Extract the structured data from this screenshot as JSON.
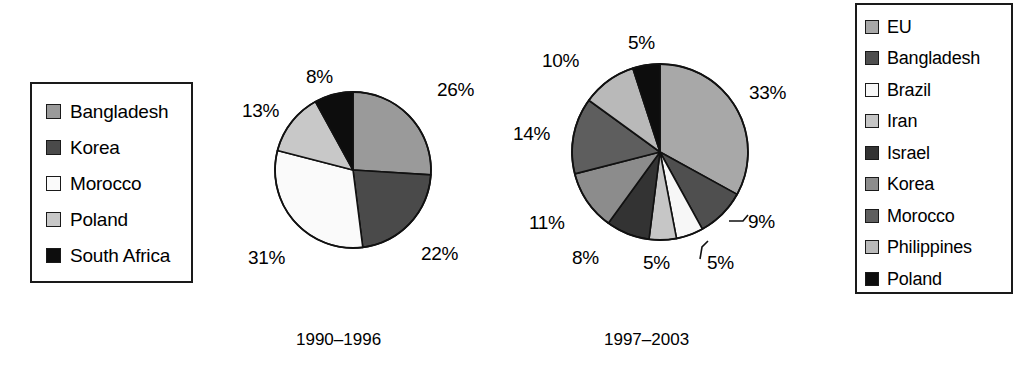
{
  "chart_data": [
    {
      "type": "pie",
      "title": "1990-1996",
      "categories": [
        "Bangladesh",
        "Korea",
        "Morocco",
        "Poland",
        "South Africa"
      ],
      "values": [
        26,
        22,
        31,
        13,
        8
      ],
      "labels": [
        "26%",
        "22%",
        "31%",
        "13%",
        "8%"
      ],
      "colors": [
        "#9a9a9a",
        "#4a4a4a",
        "#fafafa",
        "#c8c8c8",
        "#0d0d0d"
      ],
      "legend_position": "left",
      "grid": false,
      "xlabel": "",
      "ylabel": ""
    },
    {
      "type": "pie",
      "title": "1997-2003",
      "categories": [
        "EU",
        "Bangladesh",
        "Brazil",
        "Iran",
        "Israel",
        "Korea",
        "Morocco",
        "Philippines",
        "Poland"
      ],
      "values": [
        33,
        9,
        5,
        5,
        8,
        11,
        14,
        10,
        5
      ],
      "labels": [
        "33%",
        "9%",
        "5%",
        "5%",
        "8%",
        "11%",
        "14%",
        "10%",
        "5%"
      ],
      "colors": [
        "#a8a8a8",
        "#4f4f4f",
        "#f7f7f7",
        "#c6c6c6",
        "#333333",
        "#8c8c8c",
        "#5e5e5e",
        "#b9b9b9",
        "#0d0d0d"
      ],
      "legend_position": "right",
      "grid": false,
      "xlabel": "",
      "ylabel": ""
    }
  ],
  "legend_left": {
    "items": [
      {
        "label": "Bangladesh",
        "color": "#9a9a9a"
      },
      {
        "label": "Korea",
        "color": "#4a4a4a"
      },
      {
        "label": "Morocco",
        "color": "#fafafa"
      },
      {
        "label": "Poland",
        "color": "#c8c8c8"
      },
      {
        "label": "South Africa",
        "color": "#0d0d0d"
      }
    ]
  },
  "legend_right": {
    "items": [
      {
        "label": "EU",
        "color": "#a8a8a8"
      },
      {
        "label": "Bangladesh",
        "color": "#4f4f4f"
      },
      {
        "label": "Brazil",
        "color": "#f7f7f7"
      },
      {
        "label": "Iran",
        "color": "#c6c6c6"
      },
      {
        "label": "Israel",
        "color": "#333333"
      },
      {
        "label": "Korea",
        "color": "#8c8c8c"
      },
      {
        "label": "Morocco",
        "color": "#5e5e5e"
      },
      {
        "label": "Philippines",
        "color": "#b9b9b9"
      },
      {
        "label": "Poland",
        "color": "#0d0d0d"
      }
    ]
  },
  "pie1": {
    "center_x": 353,
    "center_y": 170,
    "radius": 78,
    "caption": "1990–1996",
    "pct_labels": [
      {
        "text": "26%",
        "x": 437,
        "y": 80
      },
      {
        "text": "22%",
        "x": 421,
        "y": 244
      },
      {
        "text": "31%",
        "x": 248,
        "y": 248
      },
      {
        "text": "13%",
        "x": 242,
        "y": 101
      },
      {
        "text": "8%",
        "x": 306,
        "y": 67
      }
    ]
  },
  "pie2": {
    "center_x": 660,
    "center_y": 152,
    "radius": 88,
    "caption": "1997–2003",
    "pct_labels": [
      {
        "text": "33%",
        "x": 749,
        "y": 83
      },
      {
        "text": "9%",
        "x": 748,
        "y": 212
      },
      {
        "text": "5%",
        "x": 707,
        "y": 253
      },
      {
        "text": "5%",
        "x": 643,
        "y": 253
      },
      {
        "text": "8%",
        "x": 572,
        "y": 248
      },
      {
        "text": "11%",
        "x": 529,
        "y": 213
      },
      {
        "text": "14%",
        "x": 513,
        "y": 124
      },
      {
        "text": "10%",
        "x": 542,
        "y": 51
      },
      {
        "text": "5%",
        "x": 628,
        "y": 33
      }
    ]
  }
}
